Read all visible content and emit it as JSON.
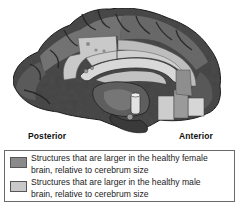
{
  "figure": {
    "orientation_labels": {
      "posterior": "Posterior",
      "anterior": "Anterior"
    }
  },
  "legend": {
    "items": [
      {
        "swatch_color": "#8a8a8a",
        "line1": "Structures that are larger in the healthy female",
        "line2": "brain, relative to cerebrum size"
      },
      {
        "swatch_color": "#c9c9c9",
        "line1": "Structures that are larger in the healthy male",
        "line2": "brain, relative to cerebrum size"
      }
    ]
  },
  "colors": {
    "female_region": "#8a8a8a",
    "male_region": "#c9c9c9",
    "brain_dark": "#3c3c3c",
    "outline": "#1a1a1a"
  }
}
